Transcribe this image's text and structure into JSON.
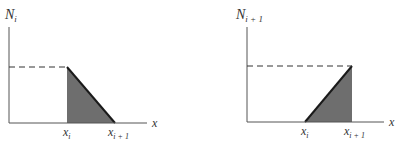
{
  "colors": {
    "axis": "#555555",
    "fill": "#6e6e6e",
    "edge": "#1a1a1a",
    "dash": "#333333"
  },
  "panels": [
    {
      "y_label": "N",
      "y_label_sub": "i",
      "x_axis_label": "x",
      "tick_left_label": "x",
      "tick_left_sub": "i",
      "tick_right_label": "x",
      "tick_right_sub": "i + 1",
      "shape": "descending ramp from 1 at x_i to 0 at x_i+1"
    },
    {
      "y_label": "N",
      "y_label_sub": "i + 1",
      "x_axis_label": "x",
      "tick_left_label": "x",
      "tick_left_sub": "i",
      "tick_right_label": "x",
      "tick_right_sub": "i + 1",
      "shape": "ascending ramp from 0 at x_i to 1 at x_i+1"
    }
  ]
}
